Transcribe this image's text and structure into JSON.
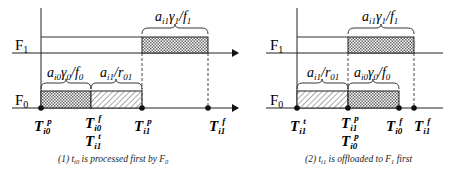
{
  "colors": {
    "line": "#222222",
    "hatch": "#555555",
    "background": "#ffffff"
  },
  "panels": [
    {
      "id": "panel-1",
      "timelines": {
        "upper": "F",
        "upper_sub": "1",
        "lower": "F",
        "lower_sub": "0"
      },
      "f1_brace": {
        "a": "a",
        "a_sub": "i1",
        "g": "γ",
        "g_sub": "1",
        "f": "/f",
        "f_sub": "1"
      },
      "f0_brace_1": {
        "a": "a",
        "a_sub": "i0",
        "g": "γ",
        "g_sub": "0",
        "f": "/f",
        "f_sub": "0"
      },
      "f0_brace_2": {
        "a": "a",
        "a_sub": "i1",
        "r": "/r",
        "r_sub": "01"
      },
      "markers": [
        {
          "T": "T",
          "sub": "i0",
          "sup": "p"
        },
        {
          "T": "T",
          "sub": "i0",
          "sup": "f"
        },
        {
          "T": "T",
          "sub": "i1",
          "sup": "t"
        },
        {
          "T": "T",
          "sub": "i1",
          "sup": "p"
        },
        {
          "T": "T",
          "sub": "i1",
          "sup": "f"
        }
      ],
      "caption": {
        "prefix": "(1) t",
        "sub": "i0",
        "rest": " is processed first by F",
        "rest_sub": "0"
      }
    },
    {
      "id": "panel-2",
      "timelines": {
        "upper": "F",
        "upper_sub": "1",
        "lower": "F",
        "lower_sub": "0"
      },
      "f1_brace": {
        "a": "a",
        "a_sub": "i1",
        "g": "γ",
        "g_sub": "1",
        "f": "/f",
        "f_sub": "1"
      },
      "f0_brace_1": {
        "a": "a",
        "a_sub": "i1",
        "r": "/r",
        "r_sub": "01"
      },
      "f0_brace_2": {
        "a": "a",
        "a_sub": "i0",
        "g": "γ",
        "g_sub": "0",
        "f": "/f",
        "f_sub": "0"
      },
      "markers": [
        {
          "T": "T",
          "sub": "i1",
          "sup": "t"
        },
        {
          "T": "T",
          "sub": "i1",
          "sup": "p"
        },
        {
          "T": "T",
          "sub": "i0",
          "sup": "p"
        },
        {
          "T": "T",
          "sub": "i0",
          "sup": "f"
        },
        {
          "T": "T",
          "sub": "i1",
          "sup": "f"
        }
      ],
      "caption": {
        "prefix": "(2) t",
        "sub": "i1",
        "rest": " is offloaded to F",
        "rest_sub": "1",
        "tail": " first"
      }
    }
  ]
}
